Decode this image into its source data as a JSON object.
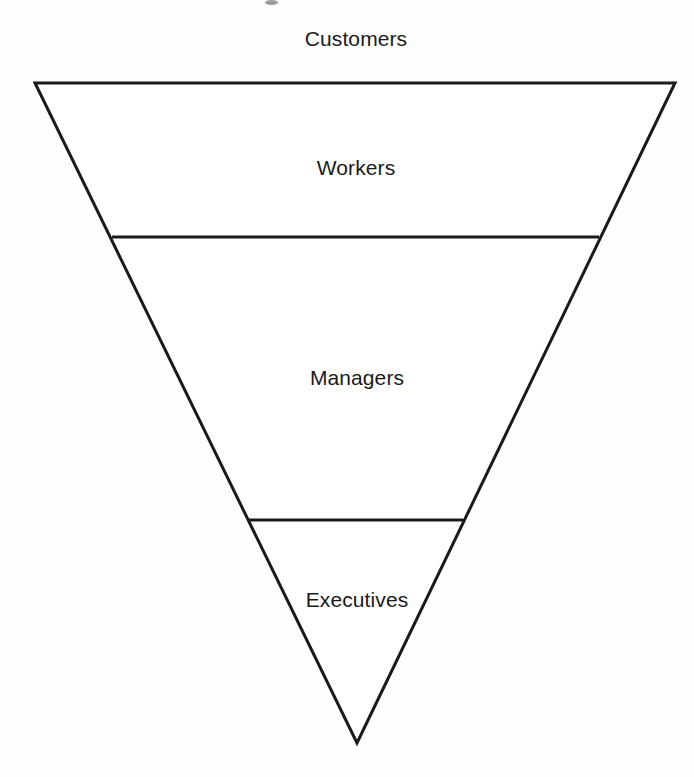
{
  "diagram": {
    "shape": "inverted-triangle",
    "orientation": "apex-down",
    "background_color": "#fefefe",
    "stroke_color": "#1a1a1a",
    "fill_color": "#ffffff",
    "stroke_width": 3,
    "external_label": {
      "name": "customers",
      "text": "Customers",
      "position": "above-apex-top",
      "x": 356,
      "y": 38
    },
    "vertices": {
      "top_left": {
        "x": 35,
        "y": 83
      },
      "top_right": {
        "x": 675,
        "y": 83
      },
      "apex": {
        "x": 357,
        "y": 743
      }
    },
    "dividers": [
      {
        "name": "workers-managers-divider",
        "y": 237,
        "x_start": 112,
        "x_end": 599,
        "stroke_width": 3
      },
      {
        "name": "managers-executives-divider",
        "y": 520,
        "x_start": 249,
        "x_end": 463,
        "stroke_width": 3
      }
    ],
    "bands": [
      {
        "name": "workers",
        "label": "Workers",
        "order": 1,
        "label_x": 356,
        "label_y": 167
      },
      {
        "name": "managers",
        "label": "Managers",
        "order": 2,
        "label_x": 357,
        "label_y": 377
      },
      {
        "name": "executives",
        "label": "Executives",
        "order": 3,
        "label_x": 357,
        "label_y": 599
      }
    ],
    "artifacts": [
      {
        "name": "scan-speck-top",
        "x": 265,
        "y": 0,
        "width": 13,
        "height": 5
      }
    ]
  }
}
